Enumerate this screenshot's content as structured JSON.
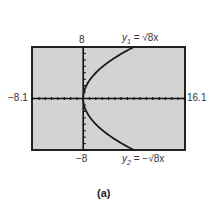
{
  "chart_data": {
    "type": "line",
    "title": "",
    "caption": "(a)",
    "window": {
      "xmin": -8.1,
      "xmax": 16.1,
      "ymin": -8,
      "ymax": 8,
      "xscl": 1,
      "yscl": 1
    },
    "labels": {
      "xmin": "−8.1",
      "xmax": "16.1",
      "ymin": "−8",
      "ymax": "8"
    },
    "grid": false,
    "background": "#d3d3d3",
    "series": [
      {
        "name": "y1 = √(8x)",
        "label_prefix": "y",
        "label_sub": "1",
        "label_rhs": " = √8x",
        "function": "sqrt(8x)",
        "x": [
          0,
          0.5,
          1,
          2,
          3,
          4,
          5,
          6,
          7,
          8
        ],
        "y": [
          0,
          2,
          2.83,
          4,
          4.9,
          5.66,
          6.32,
          6.93,
          7.48,
          8
        ]
      },
      {
        "name": "y2 = −√(8x)",
        "label_prefix": "y",
        "label_sub": "2",
        "label_rhs": " = −√8x",
        "function": "-sqrt(8x)",
        "x": [
          0,
          0.5,
          1,
          2,
          3,
          4,
          5,
          6,
          7,
          8
        ],
        "y": [
          0,
          -2,
          -2.83,
          -4,
          -4.9,
          -5.66,
          -6.32,
          -6.93,
          -7.48,
          -8
        ]
      }
    ]
  }
}
